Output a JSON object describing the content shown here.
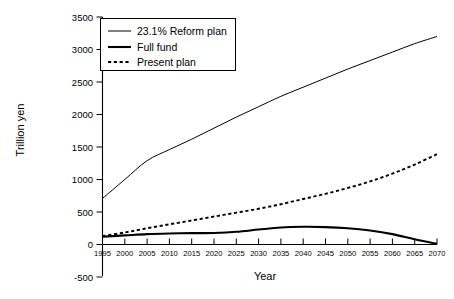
{
  "chart_data": {
    "type": "line",
    "title": "",
    "xlabel": "Year",
    "ylabel": "Trillion yen",
    "xlim": [
      1995,
      2070
    ],
    "ylim": [
      -500,
      3500
    ],
    "grid": false,
    "legend_position": "top-left",
    "x": [
      1995,
      2000,
      2005,
      2010,
      2015,
      2020,
      2025,
      2030,
      2035,
      2040,
      2045,
      2050,
      2055,
      2060,
      2065,
      2070
    ],
    "xticks": [
      "1995",
      "2000",
      "2005",
      "2010",
      "2015",
      "2020",
      "2025",
      "2030",
      "2035",
      "2040",
      "2045",
      "2050",
      "2055",
      "2060",
      "2065",
      "2070"
    ],
    "yticks": [
      "3500",
      "3000",
      "2500",
      "2000",
      "1500",
      "1000",
      "500",
      "0",
      "-500"
    ],
    "ytick_values": [
      3500,
      3000,
      2500,
      2000,
      1500,
      1000,
      500,
      0,
      -500
    ],
    "series": [
      {
        "name": "23.1% Reform plan",
        "style": "thin-solid",
        "values": [
          710,
          1000,
          1290,
          1460,
          1620,
          1790,
          1960,
          2120,
          2280,
          2420,
          2560,
          2700,
          2830,
          2960,
          3090,
          3200
        ]
      },
      {
        "name": "Full fund",
        "style": "thick-solid",
        "values": [
          120,
          140,
          160,
          170,
          175,
          178,
          195,
          230,
          262,
          272,
          268,
          250,
          215,
          160,
          80,
          10
        ]
      },
      {
        "name": "Present plan",
        "style": "dashed",
        "values": [
          130,
          185,
          250,
          310,
          370,
          430,
          490,
          550,
          620,
          700,
          780,
          870,
          970,
          1090,
          1230,
          1390
        ]
      }
    ]
  },
  "legend": {
    "entries": [
      {
        "label": "23.1% Reform plan"
      },
      {
        "label": "Full fund"
      },
      {
        "label": "Present plan"
      }
    ]
  },
  "axes": {
    "x_title": "Year",
    "y_title": "Trillion yen"
  }
}
